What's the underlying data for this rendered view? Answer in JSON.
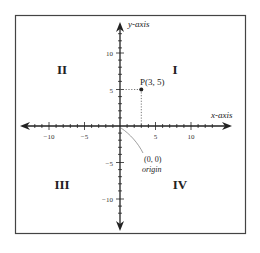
{
  "diagram": {
    "x_axis_label": "x-axis",
    "y_axis_label": "y-axis",
    "quadrants": {
      "I": "I",
      "II": "II",
      "III": "III",
      "IV": "IV"
    },
    "x_ticks": {
      "neg10": "−10",
      "neg5": "−5",
      "pos5": "5",
      "pos10": "10"
    },
    "y_ticks": {
      "pos10": "10",
      "pos5": "5",
      "neg5": "−5",
      "neg10": "−10"
    },
    "point": {
      "label": "P(3, 5)",
      "x": 3,
      "y": 5
    },
    "origin": {
      "coords": "(0, 0)",
      "label": "origin"
    },
    "colors": {
      "frame": "#444444",
      "axes": "#222222",
      "guide": "#555555"
    }
  }
}
